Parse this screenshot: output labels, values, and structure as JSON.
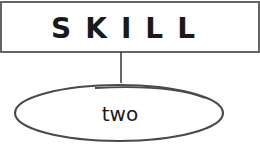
{
  "diagram": {
    "root": {
      "label": "SKILL",
      "border_color": "#555555"
    },
    "children": [
      {
        "label": "two",
        "border_color": "#555555"
      }
    ],
    "connector_color": "#333333"
  }
}
